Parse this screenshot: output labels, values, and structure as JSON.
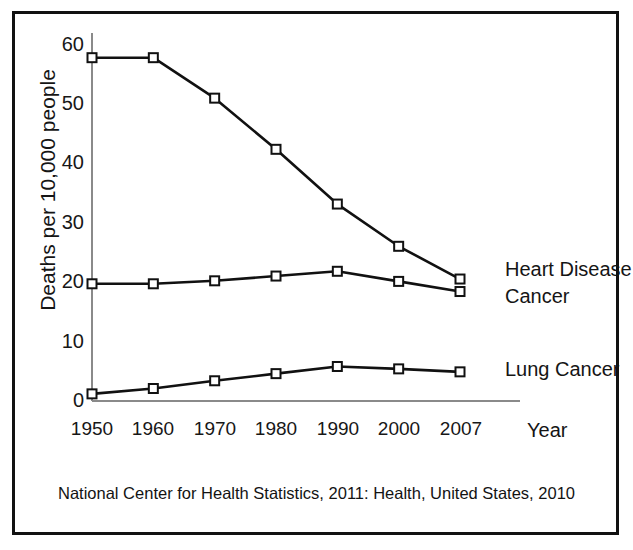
{
  "chart_data": {
    "type": "line",
    "title": "",
    "xlabel": "Year",
    "ylabel": "Deaths per 10,000 people",
    "categories": [
      "1950",
      "1960",
      "1970",
      "1980",
      "1990",
      "2000",
      "2007"
    ],
    "xlim": [
      0,
      6
    ],
    "ylim": [
      0,
      60
    ],
    "yticks": [
      "0",
      "10",
      "20",
      "30",
      "40",
      "50",
      "60"
    ],
    "grid": false,
    "legend_position": "right-inline",
    "marker": "open-square",
    "line_color": "#111111",
    "marker_fill": "#ffffff",
    "series": [
      {
        "name": "Heart Disease",
        "values": [
          57.7,
          57.7,
          50.9,
          42.3,
          33.1,
          26.0,
          20.5
        ]
      },
      {
        "name": "Cancer",
        "values": [
          19.7,
          19.7,
          20.2,
          21.0,
          21.8,
          20.1,
          18.4
        ]
      },
      {
        "name": "Lung Cancer",
        "values": [
          1.2,
          2.1,
          3.4,
          4.6,
          5.8,
          5.4,
          4.9
        ]
      }
    ],
    "caption": "National Center for Health Statistics, 2011: Health, United States, 2010"
  },
  "axis": {
    "y_title": "Deaths per 10,000 people",
    "x_title": "Year",
    "y_ticks": [
      "60",
      "50",
      "40",
      "30",
      "20",
      "10",
      "0"
    ],
    "x_ticks": [
      "1950",
      "1960",
      "1970",
      "1980",
      "1990",
      "2000",
      "2007"
    ]
  },
  "series_labels": {
    "heart_disease": "Heart Disease",
    "cancer": "Cancer",
    "lung_cancer": "Lung Cancer"
  },
  "caption": {
    "text": "National Center for Health Statistics, 2011: Health, United States, 2010"
  }
}
